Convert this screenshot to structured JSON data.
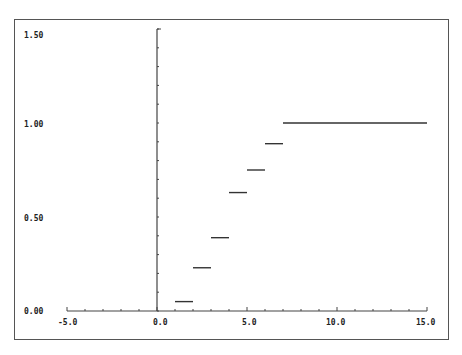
{
  "chart_data": {
    "type": "line",
    "subtype": "step (empirical CDF)",
    "title": "",
    "xlabel": "",
    "ylabel": "",
    "xlim": [
      -5.0,
      15.0
    ],
    "ylim": [
      0.0,
      1.5
    ],
    "x_ticks": [
      "-5.0",
      "0.0",
      "5.0",
      "10.0",
      "15.0"
    ],
    "y_ticks": [
      "0.00",
      "0.50",
      "1.00",
      "1.50"
    ],
    "grid": false,
    "legend": null,
    "segments": [
      {
        "x_start": 1.0,
        "x_end": 2.0,
        "y": 0.05
      },
      {
        "x_start": 2.0,
        "x_end": 3.0,
        "y": 0.23
      },
      {
        "x_start": 3.0,
        "x_end": 4.0,
        "y": 0.39
      },
      {
        "x_start": 4.0,
        "x_end": 5.0,
        "y": 0.63
      },
      {
        "x_start": 5.0,
        "x_end": 6.0,
        "y": 0.75
      },
      {
        "x_start": 6.0,
        "x_end": 7.0,
        "y": 0.89
      },
      {
        "x_start": 7.0,
        "x_end": 15.0,
        "y": 1.0
      }
    ],
    "colors": {
      "line": "#333333",
      "axis": "#444444",
      "frame": "#555555"
    }
  },
  "labels": {
    "x": [
      "-5.0",
      "0.0",
      "5.0",
      "10.0",
      "15.0"
    ],
    "y": [
      "0.00",
      "0.50",
      "1.00",
      "1.50"
    ]
  }
}
